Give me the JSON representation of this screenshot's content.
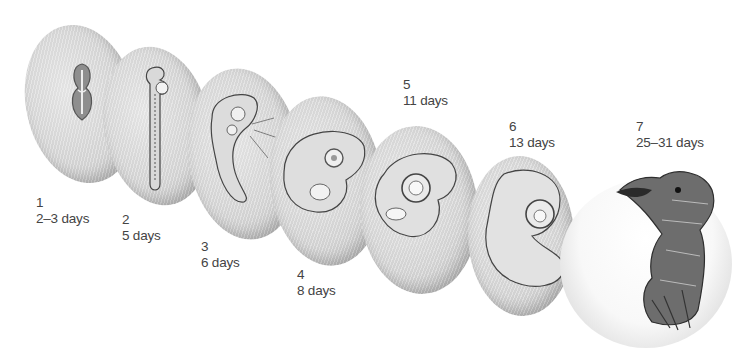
{
  "figure": {
    "title": "",
    "type": "developmental stages illustration",
    "stages": [
      {
        "number": "1",
        "age": "2–3 days",
        "description": "flat primitive-streak embryo on yolk"
      },
      {
        "number": "2",
        "age": "5 days",
        "description": "elongated embryo with neural tube and somites"
      },
      {
        "number": "3",
        "age": "6 days",
        "description": "curving embryo with head vesicles and blood vessels"
      },
      {
        "number": "4",
        "age": "8 days",
        "description": "C-shaped embryo with eye and limb buds"
      },
      {
        "number": "5",
        "age": "11 days",
        "description": "embryo with large eye and developing limbs"
      },
      {
        "number": "6",
        "age": "13 days",
        "description": "embryo with beak forming and large eye"
      },
      {
        "number": "7",
        "age": "25–31 days",
        "description": "feathered hatchling emerging from egg"
      }
    ]
  },
  "colors": {
    "background": "#ffffff",
    "egg_light": "#e4e4e4",
    "egg_dark": "#9d9d9d",
    "label_text": "#444444",
    "ink": "#3a3a3a"
  }
}
